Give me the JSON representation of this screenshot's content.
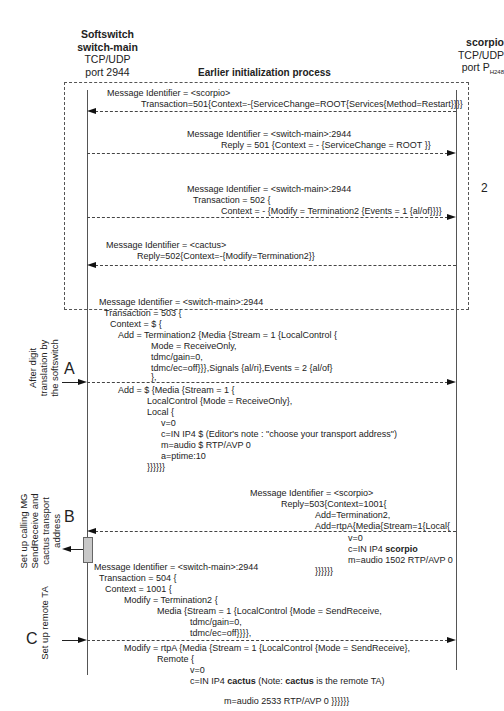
{
  "left_entity": {
    "line1": "Softswitch",
    "line2": "switch-main",
    "line3": "TCP/UDP",
    "line4": "port 2944"
  },
  "right_entity": {
    "line1": "scorpio",
    "line2": "TCP/UDP",
    "line3": "port P",
    "line3_sub": "H248"
  },
  "init_box": {
    "title": "Earlier initialization process",
    "number": "2"
  },
  "messages": {
    "m501": {
      "l1": "Message Identifier = <scorpio>",
      "l2": "Transaction=501{Context=-{ServiceChange=ROOT{Services{Method=Restart}}}}",
      "direction": "right-to-left"
    },
    "r501": {
      "l1": "Message Identifier = <switch-main>:2944",
      "l2": "Reply = 501 {Context = - {ServiceChange = ROOT }}",
      "direction": "left-to-right"
    },
    "m502": {
      "l1": "Message Identifier = <switch-main>:2944",
      "l2": "Transaction = 502 {",
      "l3": "Context = - {Modify = Termination2 {Events = 1 {al/of}}}}",
      "direction": "left-to-right"
    },
    "r502": {
      "l1": "Message Identifier = <cactus>",
      "l2": "Reply=502{Context=-{Modify=Termination2}}",
      "direction": "right-to-left"
    },
    "m503": {
      "l1": "Message Identifier = <switch-main>:2944",
      "l2": "Transaction = 503 {",
      "l3": "Context = $ {",
      "l4": "Add = Termination2 {Media {Stream = 1 {LocalControl {",
      "l5": "Mode = ReceiveOnly,",
      "l6": "tdmc/gain=0,",
      "l7": "tdmc/ec=off}}},Signals {al/ri},Events = 2 {al/of}",
      "l8": "},",
      "l9": "Add = $ {Media {Stream = 1 {",
      "l10": "LocalControl {Mode = ReceiveOnly},",
      "l11": "Local {",
      "l12": "v=0",
      "l13": "c=IN IP4 $ (Editor's note : \"choose your transport address\")",
      "l14": "m=audio $ RTP/AVP 0",
      "l15": "a=ptime:10",
      "l16": "}}}}}}",
      "direction": "left-to-right"
    },
    "r503": {
      "l1": "Message Identifier = <scorpio>",
      "l2": "Reply=503{Context=1001{",
      "l3": "Add=Termination2,",
      "l4": "Add=rtpA{Media{Stream=1{Local{",
      "l5": "v=0",
      "l6_pre": "c=IN IP4 ",
      "l6_bold": "scorpio",
      "l7": "m=audio 1502 RTP/AVP 0",
      "l8": "}}}}}}",
      "direction": "right-to-left"
    },
    "m504": {
      "l1": "Message Identifier = <switch-main>:2944",
      "l2": "Transaction = 504 {",
      "l3": "Context = 1001 {",
      "l4": "Modify = Termination2 {",
      "l5": "Media {Stream = 1 {LocalControl {Mode = SendReceive,",
      "l6": "tdmc/gain=0,",
      "l7": "tdmc/ec=off}}}},",
      "l8": "Modify = rtpA {Media {Stream = 1 {LocalControl {Mode = SendReceive},",
      "l9": "Remote {",
      "l10": "v=0",
      "l11_pre": "c=IN IP4 ",
      "l11_bold": "cactus",
      "l11_mid": " (Note: ",
      "l11_bold2": "cactus",
      "l11_post": " is the remote TA)",
      "l12": "m=audio 2533 RTP/AVP 0 }}}}}}",
      "direction": "left-to-right"
    }
  },
  "steps": {
    "A": {
      "letter": "A",
      "label": "After digit\ntranslation by\nthe softswitch"
    },
    "B": {
      "letter": "B",
      "label": "Set up calling MG\nSendReceive and\ncactus transport\naddress"
    },
    "C": {
      "letter": "C",
      "label": "Set up remote TA"
    }
  }
}
